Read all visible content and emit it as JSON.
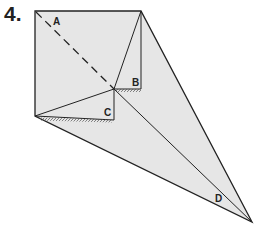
{
  "step_number": "4.",
  "labels": {
    "a": "A",
    "b": "B",
    "c": "C",
    "d": "D"
  },
  "colors": {
    "paper": "#e6e6e6",
    "line": "#222222",
    "background": "#ffffff"
  }
}
